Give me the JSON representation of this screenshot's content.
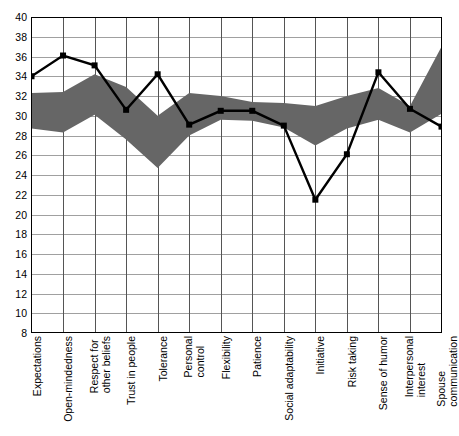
{
  "chart_data": {
    "type": "line",
    "title": "",
    "subtitle": "",
    "xlabel": "",
    "ylabel": "",
    "ylim": [
      8,
      40
    ],
    "y_tick_step": 2,
    "grid": true,
    "legend": "none",
    "categories": [
      "Expectations",
      "Open-mindedness",
      "Respect for other beliefs",
      "Trust in people",
      "Tolerance",
      "Personal control",
      "Flexibility",
      "Patience",
      "Social adaptability",
      "Initiative",
      "Risk taking",
      "Sense of humor",
      "Interpersonal interest",
      "Spouse communication"
    ],
    "category_lines": [
      [
        "Expectations"
      ],
      [
        "Open-mindedness"
      ],
      [
        "Respect for",
        "other beliefs"
      ],
      [
        "Trust in people"
      ],
      [
        "Tolerance"
      ],
      [
        "Personal",
        "control"
      ],
      [
        "Flexibility"
      ],
      [
        "Patience"
      ],
      [
        "Social adaptability"
      ],
      [
        "Initiative"
      ],
      [
        "Risk taking"
      ],
      [
        "Sense of humor"
      ],
      [
        "Interpersonal",
        "interest"
      ],
      [
        "Spouse",
        "communication"
      ]
    ],
    "y_ticks": [
      8,
      10,
      12,
      14,
      16,
      18,
      20,
      22,
      24,
      26,
      28,
      30,
      32,
      34,
      36,
      38,
      40
    ],
    "series": [
      {
        "name": "Individual profile",
        "type": "line",
        "color": "#000000",
        "marker": "square",
        "values": [
          34.0,
          36.1,
          35.1,
          30.6,
          34.2,
          29.1,
          30.5,
          30.5,
          29.0,
          21.5,
          26.1,
          34.4,
          30.7,
          28.9
        ]
      },
      {
        "name": "Norm band upper",
        "type": "band-upper",
        "color": "#666666",
        "values": [
          32.3,
          32.4,
          34.2,
          32.9,
          30.0,
          32.3,
          32.0,
          31.4,
          31.3,
          31.0,
          32.0,
          32.8,
          31.0,
          37.0
        ]
      },
      {
        "name": "Norm band lower",
        "type": "band-lower",
        "color": "#666666",
        "values": [
          28.7,
          28.3,
          30.1,
          27.6,
          24.7,
          28.0,
          29.6,
          29.5,
          28.8,
          27.0,
          28.7,
          29.6,
          28.3,
          30.2
        ]
      }
    ],
    "band_fill_color": "#666666",
    "line_color": "#000000",
    "grid_color": "#a0a0a0",
    "axis_color": "#000000",
    "plot_background": "#ffffff"
  }
}
